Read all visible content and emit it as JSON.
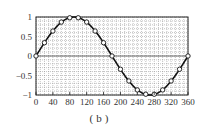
{
  "chart_data": {
    "type": "line",
    "title": "",
    "caption": "(b)",
    "xlabel": "",
    "ylabel": "",
    "xlim": [
      0,
      360
    ],
    "ylim": [
      -1,
      1
    ],
    "x_ticks": [
      0,
      40,
      80,
      120,
      160,
      200,
      240,
      280,
      320,
      360
    ],
    "y_ticks": [
      1,
      0.5,
      0,
      -0.5,
      -1
    ],
    "y_tick_labels": [
      "1",
      "0.5",
      "0",
      "−0.5",
      "−1"
    ],
    "grid": true,
    "series": [
      {
        "name": "sine curve",
        "style": "solid line",
        "x": [
          0,
          20,
          40,
          60,
          80,
          100,
          120,
          140,
          160,
          180,
          200,
          220,
          240,
          260,
          280,
          300,
          320,
          340,
          360
        ],
        "values": [
          0,
          0.34,
          0.64,
          0.87,
          0.98,
          0.98,
          0.87,
          0.64,
          0.34,
          0,
          -0.34,
          -0.64,
          -0.87,
          -0.98,
          -0.98,
          -0.87,
          -0.64,
          -0.34,
          0
        ]
      },
      {
        "name": "sample points",
        "style": "open circle markers",
        "x": [
          0,
          20,
          40,
          60,
          80,
          100,
          120,
          140,
          160,
          180,
          200,
          220,
          240,
          260,
          280,
          300,
          320,
          340,
          360
        ],
        "values": [
          0,
          0.34,
          0.64,
          0.87,
          0.98,
          0.98,
          0.87,
          0.64,
          0.34,
          0,
          -0.34,
          -0.64,
          -0.87,
          -0.98,
          -0.98,
          -0.87,
          -0.64,
          -0.34,
          0
        ]
      }
    ]
  }
}
